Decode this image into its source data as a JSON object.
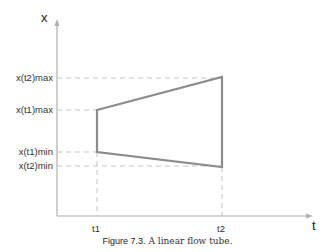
{
  "diagram": {
    "axes": {
      "y_label": "x",
      "x_label": "t"
    },
    "y_ticks": [
      {
        "id": "x_t2_max",
        "label": "x(t2)max"
      },
      {
        "id": "x_t1_max",
        "label": "x(t1)max"
      },
      {
        "id": "x_t1_min",
        "label": "x(t1)min"
      },
      {
        "id": "x_t2_min",
        "label": "x(t2)min"
      }
    ],
    "x_ticks": [
      {
        "id": "t1",
        "label": "t1"
      },
      {
        "id": "t2",
        "label": "t2"
      }
    ],
    "shape": "linear flow tube (trapezoid between t1 and t2)",
    "colors": {
      "axis": "#b0b0b0",
      "tube": "#8c8c8c",
      "guides": "#bdbdbd"
    }
  },
  "caption": {
    "figure_number": "Figure 7.3.",
    "text": "A linear flow tube."
  }
}
